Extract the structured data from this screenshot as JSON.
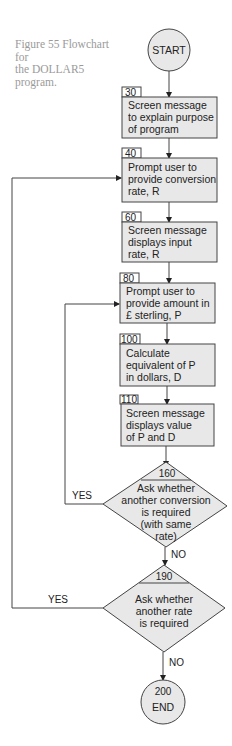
{
  "figure": {
    "caption_lines": [
      "Figure 55  Flowchart for",
      "the DOLLAR5",
      "program."
    ]
  },
  "colors": {
    "box_fill": "#e8e8e8",
    "stroke": "#444444",
    "caption": "#9a9a9a"
  },
  "nodes": {
    "start": {
      "type": "terminal",
      "label": "START"
    },
    "n30": {
      "type": "process",
      "number": "30",
      "lines": [
        "Screen message",
        "to explain purpose",
        "of  program"
      ]
    },
    "n40": {
      "type": "process",
      "number": "40",
      "lines": [
        "Prompt user to",
        "provide conversion",
        "rate,  R"
      ]
    },
    "n60": {
      "type": "process",
      "number": "60",
      "lines": [
        "Screen message",
        "displays input",
        "rate, R"
      ]
    },
    "n80": {
      "type": "process",
      "number": "80",
      "lines": [
        "Prompt user to",
        "provide amount in",
        "£ sterling, P"
      ]
    },
    "n100": {
      "type": "process",
      "number": "100",
      "lines": [
        "Calculate",
        "equivalent of P",
        "in dollars, D"
      ]
    },
    "n110": {
      "type": "process",
      "number": "110",
      "lines": [
        "Screen message",
        "displays value",
        "of P and D"
      ]
    },
    "n160": {
      "type": "decision",
      "number": "160",
      "lines": [
        "Ask whether",
        "another conversion",
        "is required",
        "(with same",
        "rate)"
      ]
    },
    "n190": {
      "type": "decision",
      "number": "190",
      "lines": [
        "Ask whether",
        "another rate",
        "is required"
      ]
    },
    "end": {
      "type": "terminal",
      "number": "200",
      "label": "END"
    }
  },
  "edges": {
    "n160_yes": "YES",
    "n160_no": "NO",
    "n190_yes": "YES",
    "n190_no": "NO"
  }
}
